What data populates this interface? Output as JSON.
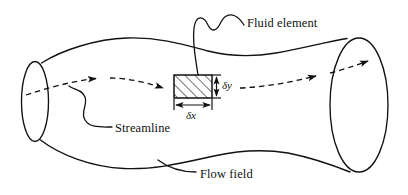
{
  "figure": {
    "type": "technical-line-diagram",
    "background_color": "#ffffff",
    "stroke_color": "#111111",
    "labels": {
      "fluid_element": "Fluid element",
      "streamline": "Streamline",
      "flow_field": "Flow field",
      "delta_y": "δy",
      "delta_x": "δx"
    },
    "elements": {
      "flow_tube": {
        "name": "flow-field-tube",
        "left_cap_label": "inlet cross-section ellipse",
        "right_cap_label": "outlet cross-section ellipse"
      },
      "streamline": {
        "name": "streamline-dashed-path",
        "style": "dashed",
        "arrowhead_count": 3
      },
      "fluid_element": {
        "name": "fluid-element-rectangle",
        "fill": "diagonal-hatch",
        "width_label": "δx",
        "height_label": "δy"
      },
      "leaders": {
        "fluid_element_leader": "wavy-leader-line",
        "streamline_leader": "curved-leader-line"
      }
    },
    "icons": {
      "arrowhead": "arrowhead-icon",
      "dimension_tick": "dimension-tick-icon"
    }
  }
}
